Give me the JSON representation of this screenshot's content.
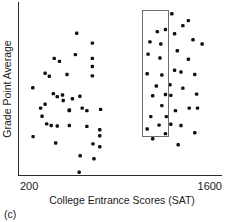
{
  "figure": {
    "caption": "(c)"
  },
  "chart_data": {
    "type": "scatter",
    "title": "",
    "xlabel": "College Entrance Scores (SAT)",
    "ylabel": "Grade Point Average",
    "xticklabels": [
      "200",
      "1600"
    ],
    "yticklabels": [],
    "xlim": [
      200,
      1600
    ],
    "ylim": [
      0,
      4
    ],
    "grid": false,
    "legend": null,
    "annotations": [
      {
        "name": "vertical-highlight-band",
        "shape": "rectangle",
        "x_range": [
          1050,
          1230
        ],
        "description": "Rectangle highlighting a narrow vertical slice of SAT scores showing wide spread of GPA"
      }
    ],
    "points": [
      [
        295,
        2.03
      ],
      [
        409,
        2.3
      ],
      [
        349,
        1.55
      ],
      [
        443,
        2.72
      ],
      [
        464,
        1.82
      ],
      [
        359,
        1.36
      ],
      [
        505,
        1.73
      ],
      [
        568,
        1.77
      ],
      [
        391,
        1.18
      ],
      [
        464,
        1.13
      ],
      [
        547,
        1.51
      ],
      [
        297,
        0.88
      ],
      [
        598,
        3.31
      ],
      [
        706,
        3.08
      ],
      [
        589,
        2.81
      ],
      [
        706,
        2.72
      ],
      [
        479,
        2.65
      ],
      [
        380,
        2.37
      ],
      [
        531,
        2.34
      ],
      [
        706,
        2.53
      ],
      [
        706,
        2.31
      ],
      [
        437,
        1.89
      ],
      [
        500,
        1.86
      ],
      [
        620,
        1.83
      ],
      [
        380,
        1.64
      ],
      [
        547,
        1.49
      ],
      [
        636,
        1.55
      ],
      [
        668,
        1.49
      ],
      [
        763,
        1.52
      ],
      [
        422,
        1.14
      ],
      [
        547,
        1.14
      ],
      [
        668,
        1.12
      ],
      [
        757,
        1.04
      ],
      [
        757,
        0.9
      ],
      [
        453,
        0.73
      ],
      [
        710,
        0.71
      ],
      [
        757,
        0.64
      ],
      [
        622,
        0.43
      ],
      [
        717,
        0.36
      ],
      [
        615,
        0.04
      ],
      [
        1154,
        3.35
      ],
      [
        1210,
        3.4
      ],
      [
        1103,
        3.11
      ],
      [
        1178,
        3.06
      ],
      [
        1090,
        2.82
      ],
      [
        1172,
        2.73
      ],
      [
        1084,
        2.36
      ],
      [
        1185,
        2.33
      ],
      [
        1147,
        2.07
      ],
      [
        1122,
        1.84
      ],
      [
        1210,
        1.87
      ],
      [
        1185,
        1.61
      ],
      [
        1109,
        1.35
      ],
      [
        1216,
        1.35
      ],
      [
        1166,
        1.15
      ],
      [
        1084,
        1.06
      ],
      [
        1210,
        0.95
      ],
      [
        1122,
        0.83
      ],
      [
        1254,
        3.77
      ],
      [
        1368,
        3.61
      ],
      [
        1330,
        3.49
      ],
      [
        1273,
        3.3
      ],
      [
        1400,
        3.16
      ],
      [
        1463,
        3.06
      ],
      [
        1292,
        2.9
      ],
      [
        1368,
        2.7
      ],
      [
        1273,
        2.44
      ],
      [
        1317,
        2.4
      ],
      [
        1412,
        2.34
      ],
      [
        1241,
        2.1
      ],
      [
        1330,
        2.02
      ],
      [
        1247,
        1.85
      ],
      [
        1425,
        1.88
      ],
      [
        1279,
        1.49
      ],
      [
        1374,
        1.55
      ],
      [
        1431,
        1.55
      ],
      [
        1247,
        1.17
      ],
      [
        1317,
        1.14
      ],
      [
        1412,
        0.97
      ],
      [
        1298,
        0.69
      ]
    ]
  }
}
